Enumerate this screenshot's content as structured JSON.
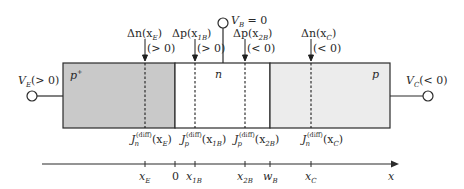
{
  "diagram": {
    "colors": {
      "emitter_fill": "#c9c9c9",
      "base_fill": "#ffffff",
      "collector_fill": "#ececec",
      "line": "#2b2b2b"
    },
    "regions": {
      "emitter": {
        "label": "p",
        "sup": "+"
      },
      "base": {
        "label": "n"
      },
      "collector": {
        "label": "p"
      }
    },
    "terminals": {
      "emitter": {
        "label": "V",
        "sub": "E",
        "cond": "(> 0)"
      },
      "base": {
        "label": "V",
        "sub": "B",
        "cond": " = 0"
      },
      "collector": {
        "label": "V",
        "sub": "C",
        "cond": "(< 0)"
      }
    },
    "excess_carriers": [
      {
        "delta": "Δn(x",
        "sub": "E",
        "close": ")",
        "sign": "(> 0)"
      },
      {
        "delta": "Δp(x",
        "sub": "1B",
        "close": ")",
        "sign": "(> 0)"
      },
      {
        "delta": "Δp(x",
        "sub": "2B",
        "close": ")",
        "sign": "(< 0)"
      },
      {
        "delta": "Δn(x",
        "sub": "C",
        "close": ")",
        "sign": "(< 0)"
      }
    ],
    "currents": [
      {
        "J": "J",
        "carrier": "n",
        "sup": "(diff)",
        "arg": "(x",
        "sub": "E",
        "close": ")"
      },
      {
        "J": "J",
        "carrier": "p",
        "sup": "(diff)",
        "arg": "(x",
        "sub": "1B",
        "close": ")"
      },
      {
        "J": "J",
        "carrier": "p",
        "sup": "(diff)",
        "arg": "(x",
        "sub": "2B",
        "close": ")"
      },
      {
        "J": "J",
        "carrier": "n",
        "sup": "(diff)",
        "arg": "(x",
        "sub": "C",
        "close": ")"
      }
    ],
    "axis": {
      "label": "x",
      "ticks": [
        {
          "main": "x",
          "sub": "E"
        },
        {
          "main": "0",
          "sub": ""
        },
        {
          "main": "x",
          "sub": "1B"
        },
        {
          "main": "x",
          "sub": "2B"
        },
        {
          "main": "w",
          "sub": "B"
        },
        {
          "main": "x",
          "sub": "C"
        }
      ]
    }
  }
}
